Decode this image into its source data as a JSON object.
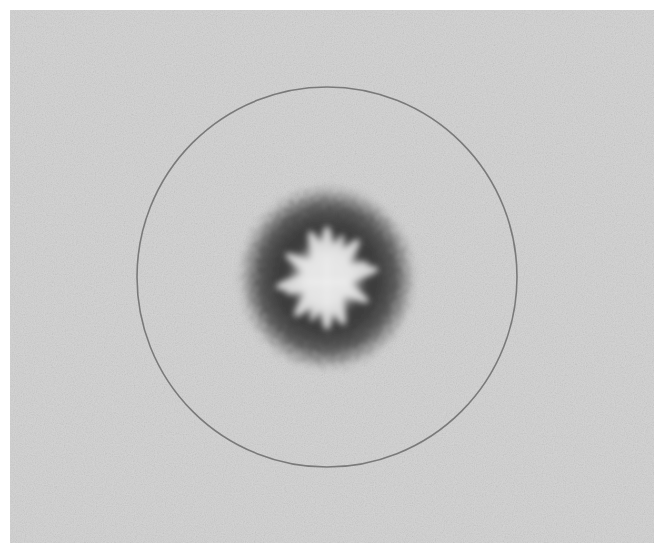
{
  "image": {
    "description": "Grayscale micrograph of a circular specimen with a dark fuzzy ring surrounding a light radiating star-shaped core, enclosed by a thin circular outline",
    "colors": {
      "background": "#d6d6d6",
      "outer_circle": "#7a7a7a",
      "dark_ring": "#3c3c3c",
      "light_core": "#e2e2e2",
      "page_margin": "#ffffff"
    },
    "geometry": {
      "outer_circle": {
        "cx": 317,
        "cy": 267,
        "r": 190
      },
      "dark_ring": {
        "cx": 317,
        "cy": 268,
        "r": 88
      },
      "light_core": {
        "cx": 317,
        "cy": 268,
        "r": 45
      }
    }
  }
}
